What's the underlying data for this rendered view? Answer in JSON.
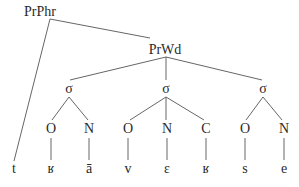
{
  "diagram": {
    "type": "prosodic-tree",
    "nodes": [
      {
        "id": "prphr",
        "label": "PrPhr",
        "x": 40,
        "y": 16,
        "anchor": {
          "x": 50,
          "y": 19
        }
      },
      {
        "id": "prwd",
        "label": "PrWd",
        "x": 165,
        "y": 54,
        "anchor": {
          "x": 166,
          "y": 57
        }
      },
      {
        "id": "sigma1",
        "label": "σ",
        "x": 69,
        "y": 93,
        "top": {
          "x": 69,
          "y": 82
        },
        "bottom": {
          "x": 69,
          "y": 97
        }
      },
      {
        "id": "sigma2",
        "label": "σ",
        "x": 166,
        "y": 93,
        "top": {
          "x": 166,
          "y": 82
        },
        "bottom": {
          "x": 166,
          "y": 97
        }
      },
      {
        "id": "sigma3",
        "label": "σ",
        "x": 263,
        "y": 93,
        "top": {
          "x": 263,
          "y": 82
        },
        "bottom": {
          "x": 263,
          "y": 97
        }
      },
      {
        "id": "o1",
        "label": "O",
        "x": 51,
        "y": 133,
        "top": {
          "x": 51,
          "y": 120
        },
        "bottom": {
          "x": 51,
          "y": 138
        }
      },
      {
        "id": "n1",
        "label": "N",
        "x": 89,
        "y": 133,
        "top": {
          "x": 89,
          "y": 120
        },
        "bottom": {
          "x": 89,
          "y": 138
        }
      },
      {
        "id": "o2",
        "label": "O",
        "x": 128,
        "y": 133,
        "top": {
          "x": 128,
          "y": 120
        },
        "bottom": {
          "x": 128,
          "y": 138
        }
      },
      {
        "id": "n2",
        "label": "N",
        "x": 167,
        "y": 133,
        "top": {
          "x": 167,
          "y": 120
        },
        "bottom": {
          "x": 167,
          "y": 138
        }
      },
      {
        "id": "c2",
        "label": "C",
        "x": 206,
        "y": 133,
        "top": {
          "x": 206,
          "y": 120
        },
        "bottom": {
          "x": 206,
          "y": 138
        }
      },
      {
        "id": "o3",
        "label": "O",
        "x": 245,
        "y": 133,
        "top": {
          "x": 245,
          "y": 120
        },
        "bottom": {
          "x": 245,
          "y": 138
        }
      },
      {
        "id": "n3",
        "label": "N",
        "x": 284,
        "y": 133,
        "top": {
          "x": 284,
          "y": 120
        },
        "bottom": {
          "x": 284,
          "y": 138
        }
      },
      {
        "id": "seg_t",
        "label": "t",
        "x": 14,
        "y": 173,
        "top": {
          "x": 14,
          "y": 161
        }
      },
      {
        "id": "seg_r1",
        "label": "ʁ",
        "x": 51,
        "y": 173,
        "top": {
          "x": 51,
          "y": 161
        }
      },
      {
        "id": "seg_a",
        "label": "ā",
        "x": 89,
        "y": 173,
        "top": {
          "x": 89,
          "y": 161
        }
      },
      {
        "id": "seg_v",
        "label": "v",
        "x": 128,
        "y": 173,
        "top": {
          "x": 128,
          "y": 161
        }
      },
      {
        "id": "seg_e1",
        "label": "ɛ",
        "x": 167,
        "y": 173,
        "top": {
          "x": 167,
          "y": 161
        }
      },
      {
        "id": "seg_r2",
        "label": "ʁ",
        "x": 206,
        "y": 173,
        "top": {
          "x": 206,
          "y": 161
        }
      },
      {
        "id": "seg_s",
        "label": "s",
        "x": 245,
        "y": 173,
        "top": {
          "x": 245,
          "y": 161
        }
      },
      {
        "id": "seg_e2",
        "label": "e",
        "x": 284,
        "y": 173,
        "top": {
          "x": 284,
          "y": 161
        }
      }
    ],
    "edges": [
      {
        "from": "prphr",
        "to": "prwd",
        "x1": 50,
        "y1": 19,
        "x2": 150,
        "y2": 38
      },
      {
        "from": "prphr",
        "to": "seg_t",
        "x1": 50,
        "y1": 19,
        "x2": 14,
        "y2": 161
      },
      {
        "from": "prwd",
        "to": "sigma1",
        "x1": 166,
        "y1": 57,
        "x2": 70,
        "y2": 80
      },
      {
        "from": "prwd",
        "to": "sigma2",
        "x1": 166,
        "y1": 57,
        "x2": 166,
        "y2": 80
      },
      {
        "from": "prwd",
        "to": "sigma3",
        "x1": 166,
        "y1": 57,
        "x2": 262,
        "y2": 80
      },
      {
        "from": "sigma1",
        "to": "o1",
        "x1": 69,
        "y1": 97,
        "x2": 52,
        "y2": 120
      },
      {
        "from": "sigma1",
        "to": "n1",
        "x1": 69,
        "y1": 97,
        "x2": 88,
        "y2": 120
      },
      {
        "from": "sigma2",
        "to": "o2",
        "x1": 166,
        "y1": 97,
        "x2": 130,
        "y2": 120
      },
      {
        "from": "sigma2",
        "to": "n2",
        "x1": 166,
        "y1": 97,
        "x2": 166,
        "y2": 120
      },
      {
        "from": "sigma2",
        "to": "c2",
        "x1": 166,
        "y1": 97,
        "x2": 204,
        "y2": 120
      },
      {
        "from": "sigma3",
        "to": "o3",
        "x1": 263,
        "y1": 97,
        "x2": 246,
        "y2": 120
      },
      {
        "from": "sigma3",
        "to": "n3",
        "x1": 263,
        "y1": 97,
        "x2": 282,
        "y2": 120
      },
      {
        "from": "o1",
        "to": "seg_r1",
        "x1": 51,
        "y1": 138,
        "x2": 51,
        "y2": 160
      },
      {
        "from": "n1",
        "to": "seg_a",
        "x1": 89,
        "y1": 138,
        "x2": 89,
        "y2": 160
      },
      {
        "from": "o2",
        "to": "seg_v",
        "x1": 128,
        "y1": 138,
        "x2": 128,
        "y2": 160
      },
      {
        "from": "n2",
        "to": "seg_e1",
        "x1": 167,
        "y1": 138,
        "x2": 167,
        "y2": 160
      },
      {
        "from": "c2",
        "to": "seg_r2",
        "x1": 206,
        "y1": 138,
        "x2": 206,
        "y2": 160
      },
      {
        "from": "o3",
        "to": "seg_s",
        "x1": 245,
        "y1": 138,
        "x2": 245,
        "y2": 160
      },
      {
        "from": "n3",
        "to": "seg_e2",
        "x1": 284,
        "y1": 138,
        "x2": 284,
        "y2": 160
      }
    ]
  }
}
